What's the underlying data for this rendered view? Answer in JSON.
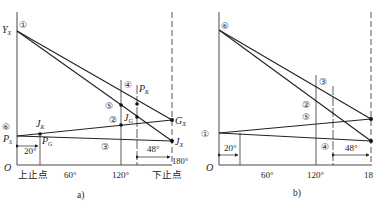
{
  "figure": {
    "panel_a": {
      "caption": "a)",
      "axis_origin": "O",
      "x_ticks": [
        {
          "label": "上止点",
          "deg": 0
        },
        {
          "label": "60°",
          "deg": 60
        },
        {
          "label": "120°",
          "deg": 120
        },
        {
          "label": "下止点",
          "deg": 180
        }
      ],
      "tick_180": "180°",
      "point_labels": {
        "YX_main": "Y",
        "YX_sub": "X",
        "PS_main": "P",
        "PS_sub": "S",
        "JK_main": "J",
        "JK_sub": "K",
        "PG_main": "P",
        "PG_sub": "G",
        "JG_main": "J",
        "JG_sub": "G",
        "PK_main": "P",
        "PK_sub": "K",
        "GX_main": "G",
        "GX_sub": "X",
        "JX_main": "J",
        "JX_sub": "X"
      },
      "circled": {
        "c1": "①",
        "c2": "②",
        "c3": "③",
        "c4": "④",
        "c5": "⑤",
        "c6": "⑥"
      },
      "dims": {
        "left": "20°",
        "right": "48°"
      }
    },
    "panel_b": {
      "caption": "b)",
      "axis_origin": "O",
      "x_ticks": [
        {
          "label": "60°",
          "deg": 60
        },
        {
          "label": "120°",
          "deg": 120
        },
        {
          "label": "18",
          "deg": 180
        }
      ],
      "circled": {
        "c6": "⑥",
        "c1": "①",
        "c3": "③",
        "c2": "②",
        "c5": "⑤",
        "c4": "④"
      },
      "dims": {
        "left": "20°",
        "right": "48°"
      }
    }
  }
}
